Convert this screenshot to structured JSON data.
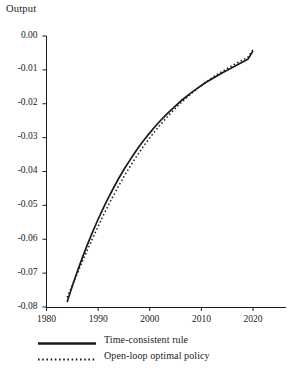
{
  "chart_data": {
    "type": "line",
    "title": "",
    "ylabel": "Output",
    "xlabel": "",
    "xlim": [
      1980,
      2027
    ],
    "ylim": [
      -0.08,
      0.0
    ],
    "grid": false,
    "legend_position": "below-left",
    "y_ticks": [
      "0.00",
      "-0.01",
      "-0.02",
      "-0.03",
      "-0.04",
      "-0.05",
      "-0.06",
      "-0.07",
      "-0.08"
    ],
    "y_tick_values": [
      0.0,
      -0.01,
      -0.02,
      -0.03,
      -0.04,
      -0.05,
      -0.06,
      -0.07,
      -0.08
    ],
    "x_ticks": [
      "1980",
      "1990",
      "2000",
      "2010",
      "2020"
    ],
    "x_tick_values": [
      1980,
      1990,
      2000,
      2010,
      2020
    ],
    "series": [
      {
        "name": "Time-consistent rule",
        "style": "solid",
        "color": "#1a1a1a",
        "x": [
          1984.0,
          1985.0,
          1986.0,
          1987.0,
          1988.0,
          1989.0,
          1990.0,
          1991.0,
          1992.0,
          1993.0,
          1994.0,
          1995.0,
          1996.0,
          1997.0,
          1998.0,
          1999.0,
          2000.0,
          2001.0,
          2002.0,
          2003.0,
          2004.0,
          2005.0,
          2006.0,
          2007.0,
          2008.0,
          2009.0,
          2010.0,
          2011.0,
          2012.0,
          2013.0,
          2014.0,
          2015.0,
          2016.0,
          2017.0,
          2018.0,
          2019.0,
          2020.0
        ],
        "y": [
          -0.0785,
          -0.0738,
          -0.0694,
          -0.0652,
          -0.0613,
          -0.0576,
          -0.0541,
          -0.0508,
          -0.0477,
          -0.0448,
          -0.042,
          -0.0394,
          -0.037,
          -0.0347,
          -0.0325,
          -0.0305,
          -0.0286,
          -0.0268,
          -0.0251,
          -0.0235,
          -0.022,
          -0.0206,
          -0.0192,
          -0.018,
          -0.0168,
          -0.0157,
          -0.0146,
          -0.0136,
          -0.0127,
          -0.0118,
          -0.0109,
          -0.0101,
          -0.0093,
          -0.0085,
          -0.0077,
          -0.0069,
          -0.0044
        ]
      },
      {
        "name": "Open-loop optimal policy",
        "style": "dotted",
        "color": "#1a1a1a",
        "x": [
          1984.0,
          1985.0,
          1986.0,
          1987.0,
          1988.0,
          1989.0,
          1990.0,
          1991.0,
          1992.0,
          1993.0,
          1994.0,
          1995.0,
          1996.0,
          1997.0,
          1998.0,
          1999.0,
          2000.0,
          2001.0,
          2002.0,
          2003.0,
          2004.0,
          2005.0,
          2006.0,
          2007.0,
          2008.0,
          2009.0,
          2010.0,
          2011.0,
          2012.0,
          2013.0,
          2014.0,
          2015.0,
          2016.0,
          2017.0,
          2018.0,
          2019.0,
          2020.0
        ],
        "y": [
          -0.0772,
          -0.0736,
          -0.07,
          -0.0664,
          -0.0629,
          -0.0595,
          -0.0562,
          -0.053,
          -0.0499,
          -0.047,
          -0.0442,
          -0.0415,
          -0.039,
          -0.0366,
          -0.0343,
          -0.0321,
          -0.0301,
          -0.0281,
          -0.0263,
          -0.0245,
          -0.0229,
          -0.0213,
          -0.0198,
          -0.0184,
          -0.0171,
          -0.0158,
          -0.0146,
          -0.0135,
          -0.0124,
          -0.0114,
          -0.0105,
          -0.0096,
          -0.0087,
          -0.0079,
          -0.0071,
          -0.0063,
          -0.004
        ]
      }
    ],
    "legend": [
      {
        "label": "Time-consistent rule",
        "style": "solid"
      },
      {
        "label": "Open-loop optimal policy",
        "style": "dotted"
      }
    ]
  },
  "axis": {
    "y_title": "Output"
  }
}
